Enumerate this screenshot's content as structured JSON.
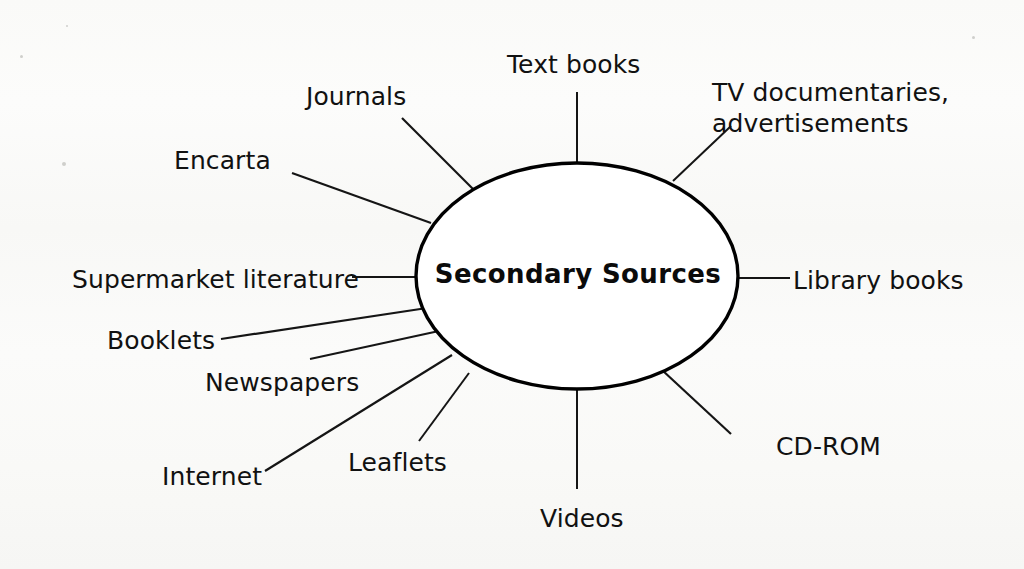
{
  "diagram": {
    "type": "spider-diagram",
    "center": {
      "label": "Secondary Sources",
      "shape": "ellipse",
      "cx": 577,
      "cy": 276,
      "rx": 161,
      "ry": 113,
      "stroke_color": "#000000",
      "stroke_width": 3.4,
      "fill_color": "#ffffff"
    },
    "background_color": "#fbfbfa",
    "line_color": "#151515",
    "text_color": "#111111",
    "branch_count": 12,
    "branches": [
      {
        "id": "text-books",
        "label": "Text books",
        "label_x": 507,
        "label_y": 50,
        "line": {
          "x1": 577,
          "y1": 92,
          "x2": 577,
          "y2": 164
        },
        "line_width": 2.0
      },
      {
        "id": "tv-documentaries",
        "label": "TV documentaries,\nadvertisements",
        "label_x": 712,
        "label_y": 78,
        "two_line": true,
        "line": {
          "x1": 731,
          "y1": 126,
          "x2": 673,
          "y2": 181
        },
        "line_width": 2.0
      },
      {
        "id": "journals",
        "label": "Journals",
        "label_x": 306,
        "label_y": 82,
        "line": {
          "x1": 402,
          "y1": 118,
          "x2": 473,
          "y2": 189
        },
        "line_width": 2.2
      },
      {
        "id": "encarta",
        "label": "Encarta",
        "label_x": 174,
        "label_y": 146,
        "line": {
          "x1": 292,
          "y1": 173,
          "x2": 431,
          "y2": 223
        },
        "line_width": 2.2
      },
      {
        "id": "supermarket-literature",
        "label": "Supermarket literature",
        "label_x": 72,
        "label_y": 265,
        "line": {
          "x1": 352,
          "y1": 277,
          "x2": 417,
          "y2": 277
        },
        "line_width": 2.0
      },
      {
        "id": "booklets",
        "label": "Booklets",
        "label_x": 107,
        "label_y": 326,
        "line": {
          "x1": 221,
          "y1": 339,
          "x2": 427,
          "y2": 308
        },
        "line_width": 2.2
      },
      {
        "id": "newspapers",
        "label": "Newspapers",
        "label_x": 205,
        "label_y": 368,
        "line": {
          "x1": 310,
          "y1": 359,
          "x2": 439,
          "y2": 331
        },
        "line_width": 2.0
      },
      {
        "id": "internet",
        "label": "Internet",
        "label_x": 162,
        "label_y": 462,
        "line": {
          "x1": 265,
          "y1": 471,
          "x2": 452,
          "y2": 355
        },
        "line_width": 2.2
      },
      {
        "id": "leaflets",
        "label": "Leaflets",
        "label_x": 348,
        "label_y": 448,
        "line": {
          "x1": 419,
          "y1": 441,
          "x2": 469,
          "y2": 373
        },
        "line_width": 2.0
      },
      {
        "id": "videos",
        "label": "Videos",
        "label_x": 540,
        "label_y": 504,
        "line": {
          "x1": 577,
          "y1": 389,
          "x2": 577,
          "y2": 489
        },
        "line_width": 2.0
      },
      {
        "id": "cd-rom",
        "label": "CD-ROM",
        "label_x": 776,
        "label_y": 432,
        "line": {
          "x1": 662,
          "y1": 370,
          "x2": 731,
          "y2": 434
        },
        "line_width": 2.2
      },
      {
        "id": "library-books",
        "label": "Library books",
        "label_x": 793,
        "label_y": 266,
        "line": {
          "x1": 738,
          "y1": 278,
          "x2": 790,
          "y2": 278
        },
        "line_width": 2.0
      }
    ]
  }
}
